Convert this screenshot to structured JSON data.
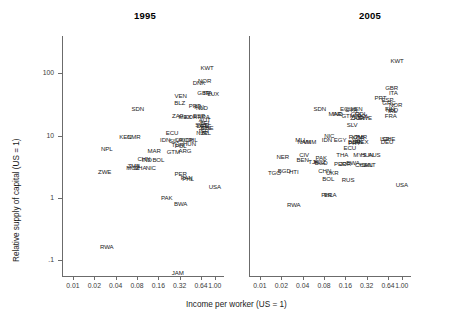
{
  "figure": {
    "xlabel": "Income per worker (US = 1)",
    "ylabel": "Relative supply of capital (US = 1)",
    "x_ticks": [
      "0.01",
      "0.02",
      "0.04",
      "0.08",
      "0.16",
      "0.32",
      "0.64",
      "1.00"
    ],
    "y_ticks": [
      "100",
      "10",
      "1",
      ".1"
    ],
    "axis_color": "#6b6b6b",
    "text_color": "#1a1a1a"
  },
  "chart_data": {
    "type": "scatter",
    "title": "",
    "xlabel": "Income per worker (US = 1)",
    "ylabel": "Relative supply of capital (US = 1)",
    "xscale": "log2",
    "yscale": "log10",
    "xlim": [
      0.007,
      1.35
    ],
    "ylim": [
      0.055,
      400
    ],
    "x_ticks": [
      0.01,
      0.02,
      0.04,
      0.08,
      0.16,
      0.32,
      0.64,
      1.0
    ],
    "x_ticklabels": [
      "0.01",
      "0.02",
      "0.04",
      "0.08",
      "0.16",
      "0.32",
      "0.64",
      "1.00"
    ],
    "y_ticks": [
      100,
      10,
      1,
      0.1
    ],
    "y_ticklabels": [
      "100",
      "10",
      "1",
      ".1"
    ],
    "grid": false,
    "legend": null,
    "marker_style": "text-label",
    "panels": [
      {
        "title": "1995",
        "points": [
          {
            "label": "KWT",
            "x": 0.78,
            "y": 120
          },
          {
            "label": "NOR",
            "x": 0.72,
            "y": 75
          },
          {
            "label": "DNK",
            "x": 0.6,
            "y": 70
          },
          {
            "label": "LUX",
            "x": 0.95,
            "y": 47
          },
          {
            "label": "ITA",
            "x": 0.8,
            "y": 48
          },
          {
            "label": "GBR",
            "x": 0.7,
            "y": 48
          },
          {
            "label": "VEN",
            "x": 0.33,
            "y": 43
          },
          {
            "label": "BLZ",
            "x": 0.32,
            "y": 33
          },
          {
            "label": "PRT",
            "x": 0.52,
            "y": 30
          },
          {
            "label": "FIN",
            "x": 0.6,
            "y": 29
          },
          {
            "label": "NLD",
            "x": 0.66,
            "y": 28
          },
          {
            "label": "SDN",
            "x": 0.082,
            "y": 27
          },
          {
            "label": "ZAF",
            "x": 0.3,
            "y": 21
          },
          {
            "label": "MEX",
            "x": 0.38,
            "y": 20
          },
          {
            "label": "KOR",
            "x": 0.46,
            "y": 20
          },
          {
            "label": "ESP",
            "x": 0.6,
            "y": 21
          },
          {
            "label": "FRA",
            "x": 0.7,
            "y": 20
          },
          {
            "label": "AUT",
            "x": 0.72,
            "y": 18
          },
          {
            "label": "BEL",
            "x": 0.74,
            "y": 16
          },
          {
            "label": "SWE",
            "x": 0.66,
            "y": 15
          },
          {
            "label": "DEU",
            "x": 0.68,
            "y": 14
          },
          {
            "label": "JPN",
            "x": 0.72,
            "y": 13
          },
          {
            "label": "CHE",
            "x": 0.78,
            "y": 13
          },
          {
            "label": "ISR",
            "x": 0.7,
            "y": 12
          },
          {
            "label": "IRL",
            "x": 0.76,
            "y": 11
          },
          {
            "label": "NZL",
            "x": 0.66,
            "y": 11
          },
          {
            "label": "ECU",
            "x": 0.25,
            "y": 11
          },
          {
            "label": "KEN",
            "x": 0.055,
            "y": 9.5
          },
          {
            "label": "CMR",
            "x": 0.072,
            "y": 9.5
          },
          {
            "label": "IDN",
            "x": 0.2,
            "y": 8.6
          },
          {
            "label": "SLV",
            "x": 0.27,
            "y": 8.3
          },
          {
            "label": "CRI",
            "x": 0.32,
            "y": 8.6
          },
          {
            "label": "KOR2",
            "x": 0.4,
            "y": 8.6
          },
          {
            "label": "CHL",
            "x": 0.47,
            "y": 8.4
          },
          {
            "label": "HUN",
            "x": 0.44,
            "y": 7.2
          },
          {
            "label": "TUR",
            "x": 0.3,
            "y": 7.0
          },
          {
            "label": "POL",
            "x": 0.33,
            "y": 6.8
          },
          {
            "label": "NPL",
            "x": 0.03,
            "y": 6.0
          },
          {
            "label": "MAR",
            "x": 0.14,
            "y": 5.6
          },
          {
            "label": "GTM",
            "x": 0.26,
            "y": 5.4
          },
          {
            "label": "ARG",
            "x": 0.38,
            "y": 5.6
          },
          {
            "label": "CHN",
            "x": 0.1,
            "y": 4.2
          },
          {
            "label": "IND",
            "x": 0.11,
            "y": 4.0
          },
          {
            "label": "BOL",
            "x": 0.16,
            "y": 4.0
          },
          {
            "label": "ZMB",
            "x": 0.072,
            "y": 3.2
          },
          {
            "label": "MOZ",
            "x": 0.07,
            "y": 3.0
          },
          {
            "label": "GHA",
            "x": 0.088,
            "y": 3.0
          },
          {
            "label": "NIC",
            "x": 0.125,
            "y": 3.0
          },
          {
            "label": "ZWE",
            "x": 0.028,
            "y": 2.6
          },
          {
            "label": "PER",
            "x": 0.33,
            "y": 2.4
          },
          {
            "label": "PHL",
            "x": 0.42,
            "y": 2.0
          },
          {
            "label": "PAN",
            "x": 0.4,
            "y": 2.1
          },
          {
            "label": "PAK",
            "x": 0.21,
            "y": 1.0
          },
          {
            "label": "BWA",
            "x": 0.33,
            "y": 0.8
          },
          {
            "label": "USA",
            "x": 1.0,
            "y": 1.5
          },
          {
            "label": "RWA",
            "x": 0.03,
            "y": 0.16
          },
          {
            "label": "JAM",
            "x": 0.3,
            "y": 0.062
          }
        ]
      },
      {
        "title": "2005",
        "points": [
          {
            "label": "KWT",
            "x": 0.86,
            "y": 160
          },
          {
            "label": "GBR",
            "x": 0.72,
            "y": 58
          },
          {
            "label": "ITA",
            "x": 0.76,
            "y": 48
          },
          {
            "label": "PRT",
            "x": 0.5,
            "y": 40
          },
          {
            "label": "ESP",
            "x": 0.63,
            "y": 38
          },
          {
            "label": "GRC",
            "x": 0.66,
            "y": 33
          },
          {
            "label": "NOR",
            "x": 0.82,
            "y": 31
          },
          {
            "label": "FIN",
            "x": 0.68,
            "y": 27
          },
          {
            "label": "NLD",
            "x": 0.73,
            "y": 26
          },
          {
            "label": "IRL",
            "x": 0.74,
            "y": 25
          },
          {
            "label": "FRA",
            "x": 0.7,
            "y": 21
          },
          {
            "label": "SDN",
            "x": 0.07,
            "y": 27
          },
          {
            "label": "ECU",
            "x": 0.165,
            "y": 27
          },
          {
            "label": "VEN",
            "x": 0.23,
            "y": 27
          },
          {
            "label": "SYR",
            "x": 0.195,
            "y": 26
          },
          {
            "label": "MAR",
            "x": 0.115,
            "y": 22
          },
          {
            "label": "IND",
            "x": 0.125,
            "y": 22
          },
          {
            "label": "GTM",
            "x": 0.175,
            "y": 21
          },
          {
            "label": "CRI",
            "x": 0.225,
            "y": 22
          },
          {
            "label": "COL",
            "x": 0.265,
            "y": 22
          },
          {
            "label": "POL",
            "x": 0.285,
            "y": 21
          },
          {
            "label": "ZAF",
            "x": 0.225,
            "y": 19
          },
          {
            "label": "JOR",
            "x": 0.245,
            "y": 19
          },
          {
            "label": "SWE",
            "x": 0.305,
            "y": 19
          },
          {
            "label": "SLV",
            "x": 0.2,
            "y": 15
          },
          {
            "label": "NIC",
            "x": 0.095,
            "y": 10
          },
          {
            "label": "MLI",
            "x": 0.037,
            "y": 8.6
          },
          {
            "label": "NAM",
            "x": 0.042,
            "y": 8.0
          },
          {
            "label": "IDN",
            "x": 0.088,
            "y": 8.4
          },
          {
            "label": "VNM",
            "x": 0.05,
            "y": 8.0
          },
          {
            "label": "EGY",
            "x": 0.135,
            "y": 8.4
          },
          {
            "label": "ROM",
            "x": 0.225,
            "y": 9.4
          },
          {
            "label": "TUR",
            "x": 0.265,
            "y": 9.6
          },
          {
            "label": "KOR",
            "x": 0.245,
            "y": 9.0
          },
          {
            "label": "BGR",
            "x": 0.215,
            "y": 8.0
          },
          {
            "label": "MEX",
            "x": 0.275,
            "y": 8.0
          },
          {
            "label": "PRY",
            "x": 0.215,
            "y": 7.6
          },
          {
            "label": "JPN",
            "x": 0.235,
            "y": 7.8
          },
          {
            "label": "ISR",
            "x": 0.58,
            "y": 8.8
          },
          {
            "label": "CHE",
            "x": 0.66,
            "y": 8.8
          },
          {
            "label": "DEU",
            "x": 0.62,
            "y": 7.8
          },
          {
            "label": "ECU2",
            "x": 0.185,
            "y": 6.2
          },
          {
            "label": "THA",
            "x": 0.145,
            "y": 4.8
          },
          {
            "label": "MYS",
            "x": 0.255,
            "y": 4.8
          },
          {
            "label": "HUN",
            "x": 0.325,
            "y": 4.8
          },
          {
            "label": "AUS",
            "x": 0.41,
            "y": 4.8
          },
          {
            "label": "NER",
            "x": 0.021,
            "y": 4.6
          },
          {
            "label": "CIV",
            "x": 0.042,
            "y": 4.8
          },
          {
            "label": "BEN",
            "x": 0.04,
            "y": 4.0
          },
          {
            "label": "PAK",
            "x": 0.073,
            "y": 4.4
          },
          {
            "label": "TJK",
            "x": 0.057,
            "y": 3.8
          },
          {
            "label": "KGZ",
            "x": 0.07,
            "y": 3.7
          },
          {
            "label": "BGD",
            "x": 0.073,
            "y": 3.6
          },
          {
            "label": "PER",
            "x": 0.135,
            "y": 3.5
          },
          {
            "label": "JOR2",
            "x": 0.16,
            "y": 3.5
          },
          {
            "label": "BWA",
            "x": 0.205,
            "y": 3.6
          },
          {
            "label": "CHL",
            "x": 0.265,
            "y": 3.4
          },
          {
            "label": "CAN",
            "x": 0.315,
            "y": 3.3
          },
          {
            "label": "MLT",
            "x": 0.355,
            "y": 3.3
          },
          {
            "label": "TGO",
            "x": 0.016,
            "y": 2.5
          },
          {
            "label": "BGD2",
            "x": 0.022,
            "y": 2.7
          },
          {
            "label": "HTI",
            "x": 0.03,
            "y": 2.6
          },
          {
            "label": "CHN",
            "x": 0.082,
            "y": 2.7
          },
          {
            "label": "UKR",
            "x": 0.105,
            "y": 2.5
          },
          {
            "label": "BOL",
            "x": 0.092,
            "y": 2.0
          },
          {
            "label": "RUS",
            "x": 0.175,
            "y": 1.9
          },
          {
            "label": "USA",
            "x": 1.0,
            "y": 1.6
          },
          {
            "label": "PHL",
            "x": 0.088,
            "y": 1.1
          },
          {
            "label": "ERA",
            "x": 0.098,
            "y": 1.1
          },
          {
            "label": "RWA",
            "x": 0.03,
            "y": 0.75
          }
        ]
      }
    ]
  }
}
